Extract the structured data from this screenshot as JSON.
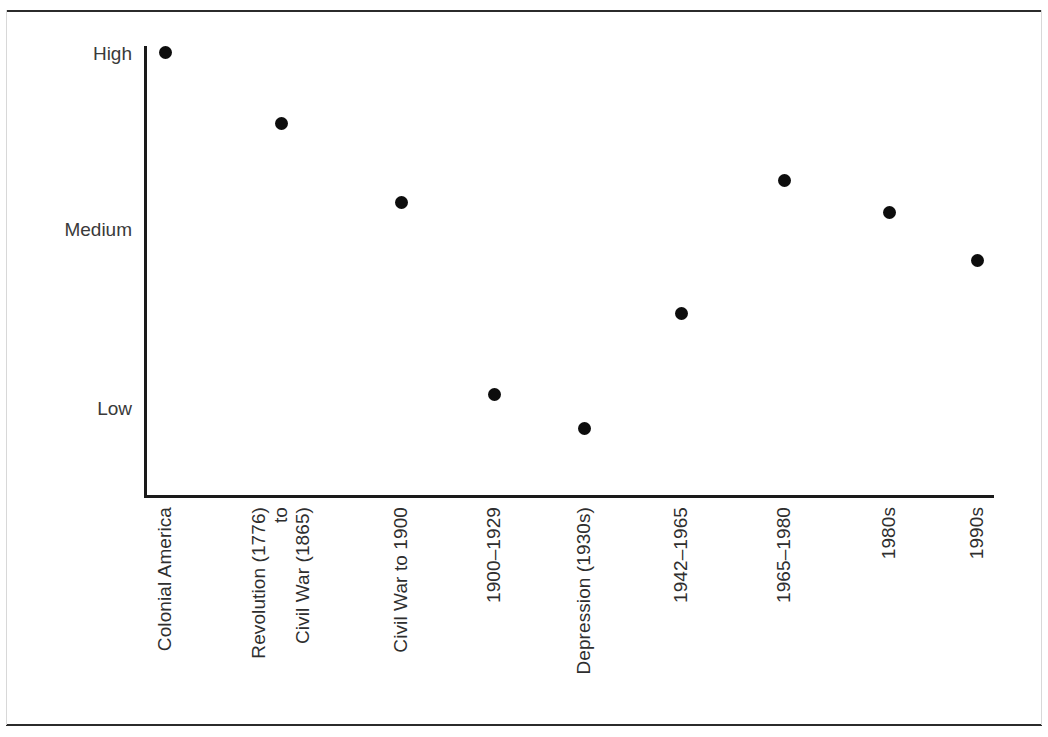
{
  "chart_data": {
    "type": "scatter",
    "title": "",
    "subtitle": "",
    "xlabel": "",
    "ylabel": "",
    "grid": false,
    "legend": false,
    "ytick_labels": [
      "High",
      "Medium",
      "Low"
    ],
    "ytick_values": [
      3,
      2,
      1
    ],
    "ylim": [
      0.55,
      3.15
    ],
    "categories": [
      "Colonial America",
      "Revolution (1776) to Civil War (1865)",
      "Civil War to 1900",
      "1900–1929",
      "Depression (1930s)",
      "1942–1965",
      "1965–1980",
      "1980s",
      "1990s"
    ],
    "category_label_lines": [
      [
        "Colonial America"
      ],
      [
        "Revolution (1776)",
        "to",
        "Civil War (1865)"
      ],
      [
        "Civil War to 1900"
      ],
      [
        "1900–1929"
      ],
      [
        "Depression (1930s)"
      ],
      [
        "1942–1965"
      ],
      [
        "1965–1980"
      ],
      [
        "1980s"
      ],
      [
        "1990s"
      ]
    ],
    "values": [
      3.0,
      2.6,
      2.15,
      1.08,
      0.89,
      1.53,
      2.28,
      2.1,
      1.83
    ],
    "value_labels": [
      "High",
      "between Medium and High",
      "slightly above Medium",
      "slightly above Low",
      "at Low",
      "between Low and Medium",
      "above Medium",
      "slightly above Medium",
      "between Medium and Low"
    ],
    "marker": {
      "shape": "circle",
      "color": "#0d0d0d",
      "size_px": 13
    },
    "axis_color": "#1a1a1a",
    "text_color": "#2e2e2e",
    "background": "#ffffff",
    "frame_rule_color": "#2b2b2b"
  },
  "layout": {
    "plot_left_px": 144,
    "plot_right_px": 994,
    "plot_top_px": 46,
    "axis_y_px": 495,
    "x_positions_px": [
      165,
      281,
      401,
      494,
      584,
      681,
      784,
      889,
      977
    ],
    "y_positions_px": [
      52,
      123,
      202,
      394,
      428,
      313,
      180,
      212,
      260
    ],
    "ytick_positions_px": [
      53,
      229,
      408
    ]
  }
}
